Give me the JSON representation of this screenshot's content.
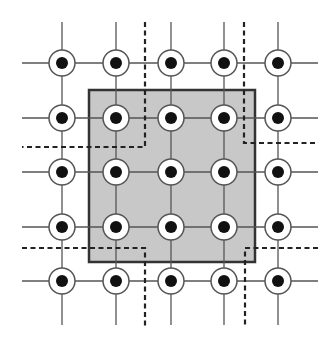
{
  "diagram": {
    "width": 334,
    "height": 337,
    "grid": {
      "columns_x": [
        62,
        116,
        171,
        224,
        278
      ],
      "rows_y": [
        63,
        118,
        172,
        227,
        281
      ],
      "line_extent": {
        "x_min": 22,
        "x_max": 318,
        "y_min": 22,
        "y_max": 325
      },
      "line_color": "#555555",
      "node_outer_radius": 13,
      "node_inner_radius": 6,
      "node_ring_color": "#555555",
      "node_fill": "#ffffff",
      "node_dot_color": "#111111"
    },
    "highlight_square": {
      "x": 89,
      "y": 90,
      "width": 166,
      "height": 172,
      "fill": "#c8c8c8",
      "stroke": "#333333"
    },
    "dashed_boundaries": [
      {
        "name": "top-left",
        "points": [
          [
            145,
            22
          ],
          [
            145,
            147
          ],
          [
            22,
            147
          ]
        ]
      },
      {
        "name": "top-right",
        "points": [
          [
            244,
            22
          ],
          [
            244,
            143
          ],
          [
            318,
            143
          ]
        ]
      },
      {
        "name": "bottom-left",
        "points": [
          [
            22,
            248
          ],
          [
            145,
            248
          ],
          [
            145,
            327
          ]
        ]
      },
      {
        "name": "bottom-right",
        "points": [
          [
            318,
            248
          ],
          [
            245,
            248
          ],
          [
            245,
            327
          ]
        ]
      }
    ],
    "dash_color": "#222222"
  }
}
